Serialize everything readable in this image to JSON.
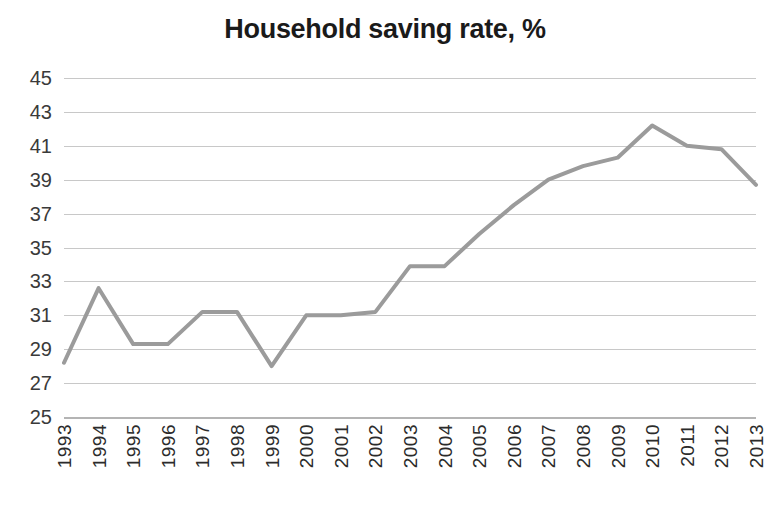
{
  "chart_data": {
    "type": "line",
    "title": "Household saving rate, %",
    "xlabel": "",
    "ylabel": "",
    "categories": [
      "1993",
      "1994",
      "1995",
      "1996",
      "1997",
      "1998",
      "1999",
      "2000",
      "2001",
      "2002",
      "2003",
      "2004",
      "2005",
      "2006",
      "2007",
      "2008",
      "2009",
      "2010",
      "2011",
      "2012",
      "2013"
    ],
    "values": [
      28.2,
      32.6,
      29.3,
      29.3,
      31.2,
      31.2,
      28.0,
      31.0,
      31.0,
      31.2,
      33.9,
      33.9,
      35.8,
      37.5,
      39.0,
      39.8,
      40.3,
      42.2,
      41.0,
      40.8,
      38.7
    ],
    "series": [
      {
        "name": "Household saving rate",
        "values": [
          28.2,
          32.6,
          29.3,
          29.3,
          31.2,
          31.2,
          28.0,
          31.0,
          31.0,
          31.2,
          33.9,
          33.9,
          35.8,
          37.5,
          39.0,
          39.8,
          40.3,
          42.2,
          41.0,
          40.8,
          38.7
        ]
      }
    ],
    "ylim": [
      25,
      45
    ],
    "ytick_step": 2,
    "yticks": [
      45,
      43,
      41,
      39,
      37,
      35,
      33,
      31,
      29,
      27,
      25
    ],
    "grid": true,
    "legend": false,
    "legend_position": "none",
    "line_color": "#9b9b9b",
    "grid_color": "#c8c8c8",
    "axis_color": "#b4b4b4",
    "background_color": "#ffffff",
    "title_color": "#1a1a1a",
    "tick_label_color": "#3a3a3a",
    "xtick_rotation": 90,
    "line_width": 4
  }
}
